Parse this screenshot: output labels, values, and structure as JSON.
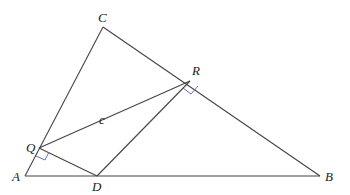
{
  "diagram": {
    "type": "geometry",
    "colors": {
      "line": "#444444",
      "right_angle_mark": "#5b6fc4",
      "label": "#222222"
    },
    "points": {
      "A": {
        "label": "A",
        "x": 25,
        "y": 176
      },
      "B": {
        "label": "B",
        "x": 320,
        "y": 176
      },
      "C": {
        "label": "C",
        "x": 103,
        "y": 27
      },
      "R": {
        "label": "R",
        "x": 190,
        "y": 81
      },
      "Q": {
        "label": "Q",
        "x": 39,
        "y": 148
      },
      "D": {
        "label": "D",
        "x": 97,
        "y": 176
      }
    },
    "segments": [
      "AB",
      "AC",
      "CB",
      "QR",
      "QD",
      "DR"
    ],
    "right_angles": [
      "R",
      "Q"
    ],
    "segment_labels": [
      {
        "text": "c",
        "segment": "QR"
      }
    ]
  }
}
